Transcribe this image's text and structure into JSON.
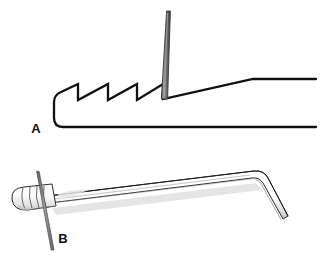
{
  "figure": {
    "background_color": "#ffffff",
    "width": 322,
    "height": 268,
    "panels": [
      {
        "id": "panel-a",
        "label": "A",
        "label_x": 36,
        "label_y": 133,
        "caption": "Cross-sectional side view: serrated (sawtooth) jaw profile of instrument with needle held vertically at the terminal groove",
        "elements": {
          "outline_color": "#111111",
          "outline_width": 2.2,
          "needle": {
            "name": "vertical-needle",
            "fill_top": "#6e6e6e",
            "fill_body": "#8c8c8c",
            "edge_color": "#3a3a3a",
            "tip_x": 168,
            "tip_y": 11,
            "base_x": 163,
            "base_y": 99
          },
          "sawtooth": {
            "teeth_count": 3,
            "peaks": [
              {
                "x": 78,
                "y": 84
              },
              {
                "x": 108,
                "y": 84
              },
              {
                "x": 137,
                "y": 84
              }
            ],
            "valleys": [
              {
                "x": 78,
                "y": 100
              },
              {
                "x": 108,
                "y": 100
              },
              {
                "x": 137,
                "y": 100
              }
            ],
            "start": {
              "x": 54,
              "y": 99
            },
            "end": {
              "x": 163,
              "y": 99
            }
          },
          "ramp": {
            "name": "upper-ramp",
            "from": {
              "x": 163,
              "y": 99
            },
            "knee": {
              "x": 253,
              "y": 79
            },
            "to": {
              "x": 316,
              "y": 79
            }
          },
          "base_line": {
            "name": "lower-base-line",
            "from": {
              "x": 54,
              "y": 127
            },
            "to": {
              "x": 316,
              "y": 127
            },
            "corner_radius": 9
          }
        }
      },
      {
        "id": "panel-b",
        "label": "B",
        "label_x": 63,
        "label_y": 243,
        "caption": "Perspective view: ribbed-handled cannulated instrument shaft with distal downward bend and needle passing transversely through the handle",
        "elements": {
          "outline_color": "#2b2b2b",
          "outline_width": 1.0,
          "body_fill": "#ffffff",
          "shadow_color": "#c9c9c9",
          "highlight_color": "#f2f2f2",
          "handle": {
            "name": "ribbed-handle",
            "rib_count": 4,
            "rib_color": "#555555",
            "x": 12,
            "y": 186,
            "width": 42,
            "height": 34
          },
          "shaft": {
            "name": "instrument-shaft",
            "from": {
              "x": 50,
              "y": 200
            },
            "to": {
              "x": 258,
              "y": 175
            }
          },
          "bend": {
            "name": "distal-bend",
            "apex": {
              "x": 266,
              "y": 176
            },
            "tip": {
              "x": 290,
              "y": 222
            }
          },
          "needle": {
            "name": "transverse-needle",
            "color": "#7d7d7d",
            "edge_color": "#4a4a4a",
            "top": {
              "x": 37,
              "y": 172
            },
            "bottom": {
              "x": 53,
              "y": 250
            }
          }
        }
      }
    ]
  }
}
